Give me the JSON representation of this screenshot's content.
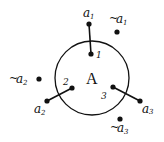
{
  "diagram": {
    "circle": {
      "label": "A",
      "cx": 92,
      "cy": 78,
      "r": 37,
      "color": "#111111"
    },
    "connectors": [
      {
        "id": "1",
        "inner_label": "1",
        "outer_label": "a",
        "outer_sub": "1",
        "inner": [
          91,
          54
        ],
        "outer": [
          89,
          24
        ]
      },
      {
        "id": "2",
        "inner_label": "2",
        "outer_label": "a",
        "outer_sub": "2",
        "inner": [
          72,
          88
        ],
        "outer": [
          47,
          101
        ]
      },
      {
        "id": "3",
        "inner_label": "3",
        "outer_label": "a",
        "outer_sub": "3",
        "inner": [
          113,
          87
        ],
        "outer": [
          140,
          101
        ]
      }
    ],
    "negated_points": [
      {
        "id": "n1",
        "prefix": "~",
        "label": "a",
        "sub": "1",
        "pos": [
          117,
          32
        ]
      },
      {
        "id": "n2",
        "prefix": "~",
        "label": "a",
        "sub": "2",
        "pos": [
          39,
          79
        ]
      },
      {
        "id": "n3",
        "prefix": "~",
        "label": "a",
        "sub": "3",
        "pos": [
          120,
          119
        ]
      }
    ]
  },
  "text": {
    "center": "A",
    "inner1": "1",
    "inner2": "2",
    "inner3": "3",
    "a": "a",
    "s1": "1",
    "s2": "2",
    "s3": "3",
    "tilde": "~"
  }
}
